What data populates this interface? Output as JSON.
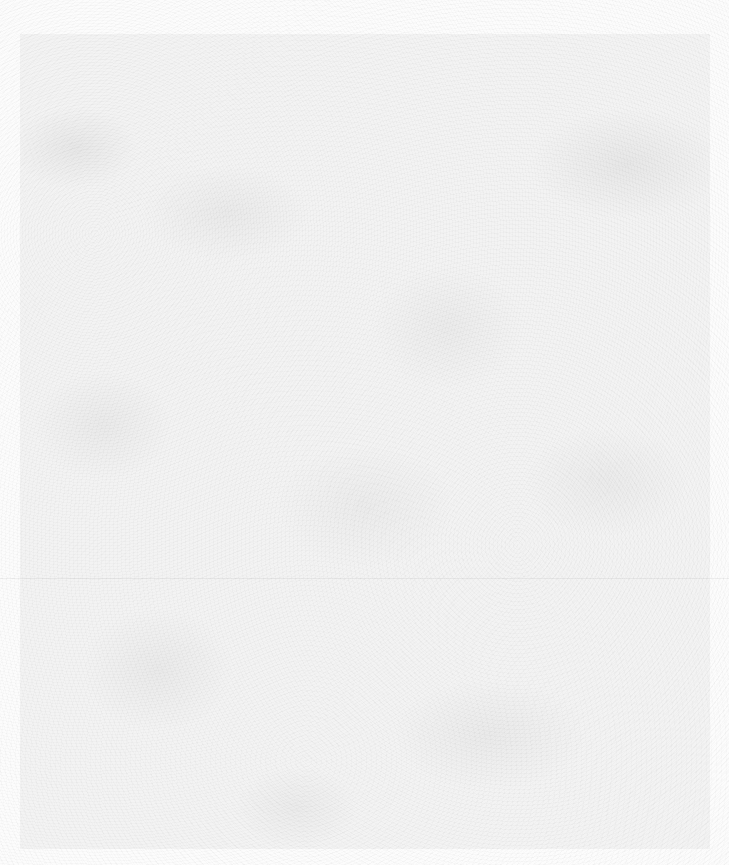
{
  "page": {
    "type": "blank-scanned-sheet",
    "text_content": "",
    "background_color": "#fcfcfc",
    "inner_area_color": "#f3f3f3"
  }
}
